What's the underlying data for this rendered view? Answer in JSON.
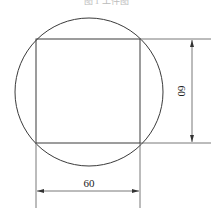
{
  "caption": "图 1  工件图",
  "figure": {
    "shapes": [
      "circle",
      "inscribed-square"
    ],
    "dimensions": {
      "width_label": "60",
      "height_label": "60"
    }
  }
}
